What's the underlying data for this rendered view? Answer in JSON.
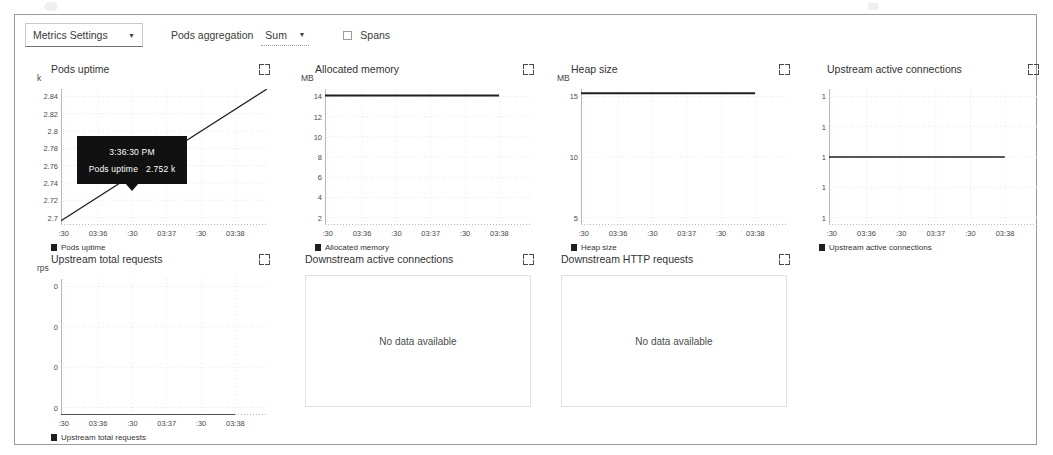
{
  "toolbar": {
    "metrics_settings_label": "Metrics Settings",
    "metrics_settings_caret": "chevron-down-icon",
    "pods_aggregation_label": "Pods aggregation",
    "pods_aggregation_value": "Sum",
    "pods_aggregation_caret": "chevron-down-icon",
    "spans_label": "Spans",
    "spans_checked": false
  },
  "tooltip": {
    "time": "3:36:30 PM",
    "series_name": "Pods uptime",
    "value": "2.752 k"
  },
  "colors": {
    "line": "#1f1f1f",
    "grid": "#e8e8e8",
    "axis": "#b8b8b8",
    "panel_border": "#9a9a9a",
    "tooltip_bg": "#111111",
    "text": "#333333"
  },
  "charts": [
    {
      "title": "Pods uptime",
      "unit": "k",
      "legend": "Pods uptime",
      "expand_icon": "expand-icon",
      "no_data": false,
      "chart_data": {
        "type": "line",
        "title": "Pods uptime",
        "ylabel": "k",
        "xlabel": "",
        "yticks": [
          "2.84",
          "2.82",
          "2.8",
          "2.78",
          "2.76",
          "2.74",
          "2.72",
          "2.7"
        ],
        "xticks": [
          ":30",
          "03:36",
          ":30",
          "03:37",
          ":30",
          "03:38"
        ],
        "ylim": [
          2.69,
          2.85
        ],
        "grid": true,
        "legend_position": "bottom-left",
        "series": [
          {
            "name": "Pods uptime",
            "x": [
              0,
              100
            ],
            "values": [
              2.695,
              2.85
            ]
          }
        ],
        "annotations": [
          {
            "label": "3:36:30 PM",
            "value": "2.752 k",
            "x": 0.37,
            "y": 2.752
          }
        ]
      }
    },
    {
      "title": "Allocated memory",
      "unit": "MB",
      "legend": "Allocated memory",
      "expand_icon": "expand-icon",
      "no_data": false,
      "chart_data": {
        "type": "line",
        "title": "Allocated memory",
        "ylabel": "MB",
        "xlabel": "",
        "yticks": [
          "14",
          "12",
          "10",
          "8",
          "6",
          "4",
          "2"
        ],
        "xticks": [
          ":30",
          "03:36",
          ":30",
          "03:37",
          ":30",
          "03:38"
        ],
        "ylim": [
          0,
          15.6
        ],
        "grid": true,
        "legend_position": "bottom-left",
        "series": [
          {
            "name": "Allocated memory",
            "x": [
              0,
              100
            ],
            "values": [
              14.85,
              14.85
            ]
          }
        ]
      }
    },
    {
      "title": "Heap size",
      "unit": "MB",
      "legend": "Heap size",
      "expand_icon": "expand-icon",
      "no_data": false,
      "chart_data": {
        "type": "line",
        "title": "Heap size",
        "ylabel": "MB",
        "xlabel": "",
        "yticks": [
          "15",
          "10",
          "5"
        ],
        "xticks": [
          ":30",
          "03:36",
          ":30",
          "03:37",
          ":30",
          "03:38"
        ],
        "ylim": [
          0,
          19.5
        ],
        "grid": true,
        "legend_position": "bottom-left",
        "series": [
          {
            "name": "Heap size",
            "x": [
              0,
              100
            ],
            "values": [
              18.9,
              18.9
            ]
          }
        ]
      }
    },
    {
      "title": "Upstream active connections",
      "unit": "",
      "legend": "Upstream active connections",
      "expand_icon": "expand-icon",
      "no_data": false,
      "chart_data": {
        "type": "line",
        "title": "Upstream active connections",
        "ylabel": "",
        "xlabel": "",
        "yticks": [
          "1",
          "1",
          "1",
          "1",
          "1"
        ],
        "xticks": [
          ":30",
          "03:36",
          ":30",
          "03:37",
          ":30",
          "03:38"
        ],
        "ylim": [
          0,
          2
        ],
        "grid": true,
        "legend_position": "bottom-left",
        "series": [
          {
            "name": "Upstream active connections",
            "x": [
              0,
              100
            ],
            "values": [
              1,
              1
            ]
          }
        ]
      }
    },
    {
      "title": "Upstream total requests",
      "unit": "rps",
      "legend": "Upstream total requests",
      "expand_icon": "expand-icon",
      "no_data": false,
      "chart_data": {
        "type": "line",
        "title": "Upstream total requests",
        "ylabel": "rps",
        "xlabel": "",
        "yticks": [
          "0",
          "0",
          "0",
          "0"
        ],
        "xticks": [
          ":30",
          "03:36",
          ":30",
          "03:37",
          ":30",
          "03:38"
        ],
        "ylim": [
          0,
          1
        ],
        "grid": true,
        "legend_position": "bottom-left",
        "series": [
          {
            "name": "Upstream total requests",
            "x": [
              0,
              100
            ],
            "values": [
              0,
              0
            ]
          }
        ]
      }
    },
    {
      "title": "Downstream active connections",
      "unit": "",
      "legend": "",
      "expand_icon": "expand-icon",
      "no_data": true,
      "no_data_text": "No data available",
      "chart_data": {
        "type": "line",
        "title": "Downstream active connections",
        "series": [],
        "note": "No data available"
      }
    },
    {
      "title": "Downstream HTTP requests",
      "unit": "",
      "legend": "",
      "expand_icon": "expand-icon",
      "no_data": true,
      "no_data_text": "No data available",
      "chart_data": {
        "type": "line",
        "title": "Downstream HTTP requests",
        "series": [],
        "note": "No data available"
      }
    }
  ]
}
